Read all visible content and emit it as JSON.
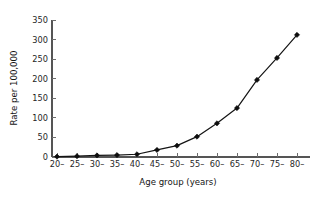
{
  "chart_data": {
    "type": "line",
    "title": "",
    "subtitle": "",
    "xlabel": "Age group (years)",
    "ylabel": "Rate per 100,000",
    "categories": [
      "20–",
      "25–",
      "30–",
      "35–",
      "40–",
      "45–",
      "50–",
      "55–",
      "60–",
      "65–",
      "70–",
      "75–",
      "80–"
    ],
    "values": [
      1,
      2,
      4,
      5,
      7,
      18,
      29,
      52,
      86,
      125,
      197,
      253,
      312
    ],
    "series": [
      {
        "name": "Rate",
        "values": [
          1,
          2,
          4,
          5,
          7,
          18,
          29,
          52,
          86,
          125,
          197,
          253,
          312
        ]
      }
    ],
    "ylim": [
      0,
      350
    ],
    "yticks": [
      0,
      50,
      100,
      150,
      200,
      250,
      300,
      350
    ],
    "ytick_labels": [
      "0",
      "50",
      "100",
      "150",
      "200",
      "250",
      "300",
      "350"
    ],
    "xtick_labels": [
      "20–",
      "25–",
      "30–",
      "35–",
      "40–",
      "45–",
      "50–",
      "55–",
      "60–",
      "65–",
      "70–",
      "75–",
      "80–"
    ],
    "grid": false,
    "legend": false,
    "legend_position": "none",
    "marker": "filled-diamond",
    "line_color": "#141414",
    "marker_color": "#0d0d0d",
    "axis_color": "#555555",
    "background_color": "#ffffff",
    "annotations": []
  },
  "axis_titles": {
    "x": "Age group (years)",
    "y": "Rate per 100,000"
  }
}
